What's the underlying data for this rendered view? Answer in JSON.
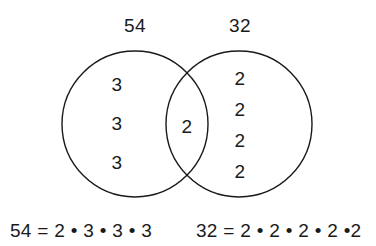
{
  "figure": {
    "background_color": "#ffffff",
    "ink_color": "#1a1a1a"
  },
  "sets": {
    "left": {
      "label": "54",
      "exclusive_factors": [
        "3",
        "3",
        "3"
      ]
    },
    "right": {
      "label": "32",
      "exclusive_factors": [
        "2",
        "2",
        "2",
        "2"
      ]
    },
    "intersection": {
      "shared_factors": [
        "2"
      ]
    }
  },
  "equations": {
    "left": "54 = 2 • 3 • 3 • 3",
    "right": "32 = 2 • 2 • 2 • 2 •2"
  }
}
